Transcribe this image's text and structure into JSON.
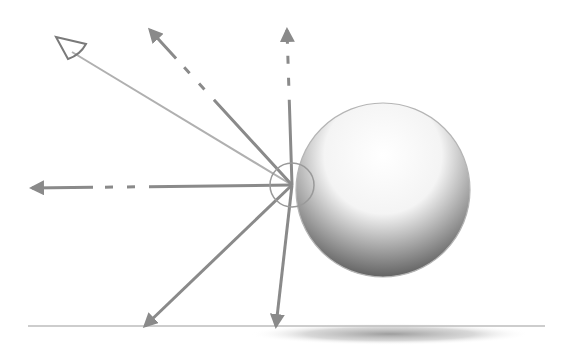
{
  "diagram": {
    "colors": {
      "background": "#ffffff",
      "arrow": "#8a8a8a",
      "arrow_light": "#b0b0b0",
      "eye": "#7a7a7a",
      "sphere_light": "#ffffff",
      "sphere_dark": "#5a5a5a",
      "sphere_outline": "#b5b5b5",
      "ground": "#bdbdbd",
      "shadow": "#8c8c8c"
    },
    "hit_point": {
      "x": 292,
      "y": 185
    },
    "sphere": {
      "cx": 383,
      "cy": 190,
      "r": 87
    },
    "ground": {
      "x1": 28,
      "x2": 545,
      "y": 326
    },
    "shadow": {
      "cx": 390,
      "cy": 334,
      "rx": 140,
      "ry": 11
    },
    "angle_marker": {
      "r": 22
    },
    "eye": {
      "x": 62,
      "y": 45
    },
    "arrows": [
      {
        "name": "view-ray",
        "to": [
          72,
          52
        ],
        "style": "solid-light",
        "head": "eye"
      },
      {
        "name": "reflected-up-left",
        "to": [
          150,
          30
        ],
        "style": "dashed",
        "head": "filled"
      },
      {
        "name": "reflected-up",
        "to": [
          287,
          30
        ],
        "style": "dashed",
        "head": "filled"
      },
      {
        "name": "reflected-left",
        "to": [
          32,
          188
        ],
        "style": "dashed",
        "head": "filled"
      },
      {
        "name": "scattered-down-left",
        "to": [
          145,
          326
        ],
        "style": "solid",
        "head": "filled"
      },
      {
        "name": "scattered-down",
        "to": [
          276,
          326
        ],
        "style": "solid",
        "head": "filled"
      }
    ]
  }
}
